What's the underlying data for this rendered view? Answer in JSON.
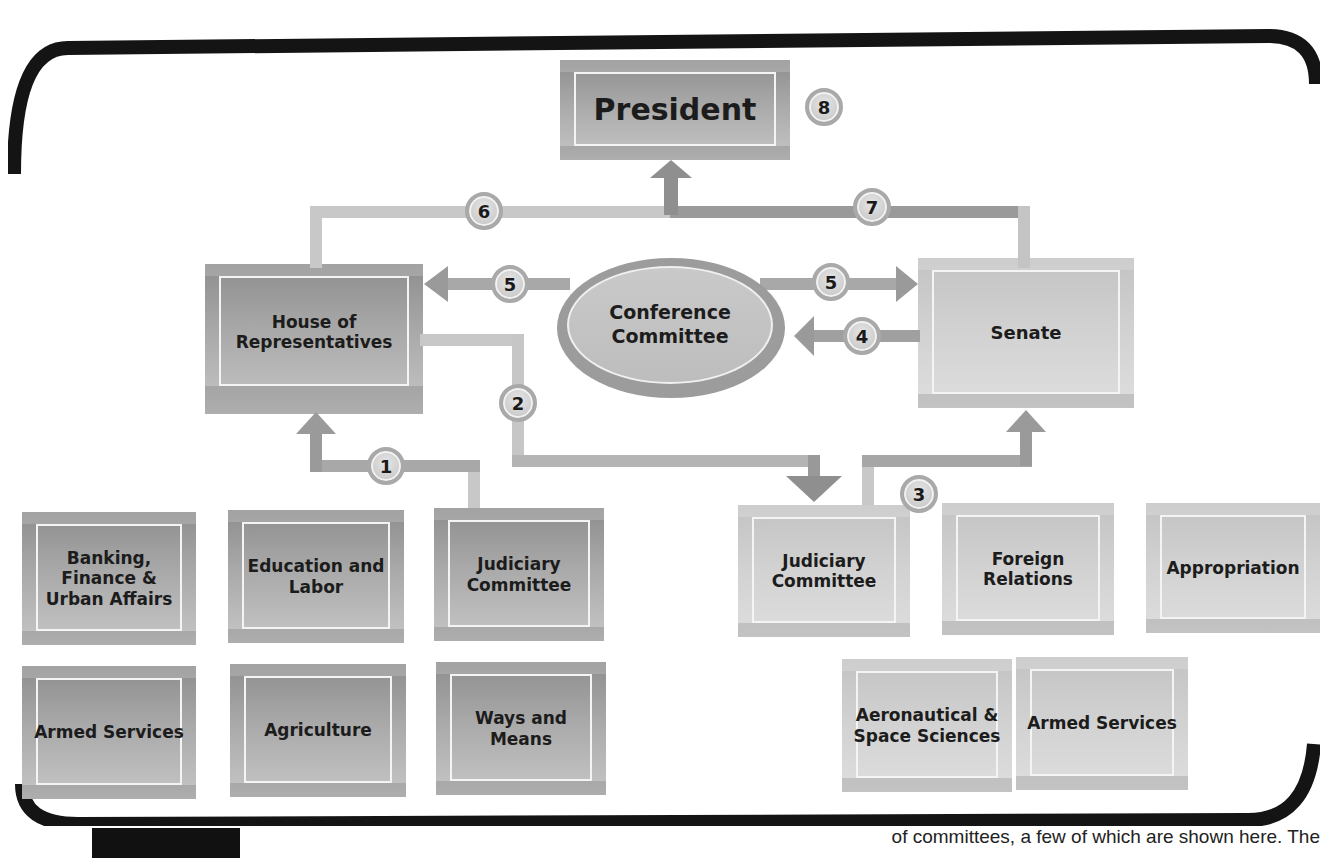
{
  "diagram": {
    "type": "flowchart",
    "nodes": {
      "president": "President",
      "house": "House of Representatives",
      "senate": "Senate",
      "conference": "Conference Committee"
    },
    "house_committees": [
      "Banking, Finance & Urban Affairs",
      "Education and Labor",
      "Judiciary Committee",
      "Armed Services",
      "Agriculture",
      "Ways and Means"
    ],
    "senate_committees": [
      "Judiciary Committee",
      "Foreign Relations",
      "Appropriation",
      "Aeronautical & Space Sciences",
      "Armed Services"
    ],
    "steps": [
      "1",
      "2",
      "3",
      "4",
      "5",
      "5",
      "6",
      "7",
      "8"
    ],
    "edges": [
      {
        "step": "1",
        "from": "House Judiciary Committee",
        "to": "House of Representatives"
      },
      {
        "step": "2",
        "from": "House of Representatives",
        "to": "Senate Judiciary Committee"
      },
      {
        "step": "3",
        "from": "Senate Judiciary Committee",
        "to": "Senate"
      },
      {
        "step": "4",
        "from": "Senate",
        "to": "Conference Committee"
      },
      {
        "step": "5",
        "from": "Conference Committee",
        "to": "House of Representatives"
      },
      {
        "step": "5",
        "from": "Conference Committee",
        "to": "Senate"
      },
      {
        "step": "6",
        "from": "House of Representatives",
        "to": "President"
      },
      {
        "step": "7",
        "from": "Senate",
        "to": "President"
      },
      {
        "step": "8",
        "at": "President"
      }
    ],
    "colors": {
      "house_box": "#9e9e9e",
      "senate_box": "#cfcfcf",
      "connector_dark": "#9a9a9a",
      "connector_light": "#c8c8c8",
      "frame": "#111111"
    }
  },
  "caption": {
    "text": "of committees, a few of which are shown here. The"
  }
}
